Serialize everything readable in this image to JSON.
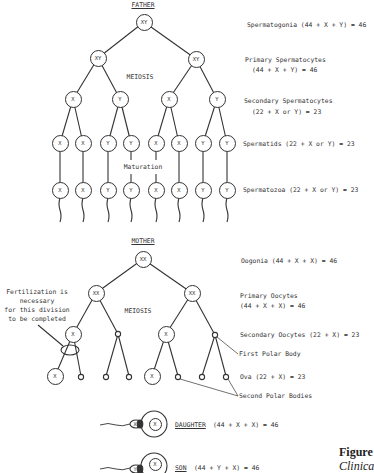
{
  "father": {
    "title": "FATHER",
    "meiosis_label": "MEIOSIS",
    "maturation_label": "Maturation",
    "root": "XY",
    "level2": [
      "XY",
      "XY"
    ],
    "level3": [
      "X",
      "Y",
      "X",
      "Y"
    ],
    "spermatids": [
      "X",
      "X",
      "Y",
      "Y",
      "X",
      "X",
      "Y",
      "Y"
    ],
    "spermatozoa": [
      "X",
      "X",
      "Y",
      "Y",
      "X",
      "X",
      "Y",
      "Y"
    ],
    "stages": {
      "spermatogonia": "Spermatogonia  (44 + X + Y) = 46",
      "primary_line1": "Primary Spermatocytes",
      "primary_line2": "(44 + X + Y) = 46",
      "secondary_line1": "Secondary Spermatocytes",
      "secondary_line2": "(22 + X or Y) = 23",
      "spermatids": "Spermatids  (22 + X or Y) = 23",
      "spermatozoa": "Spermatozoa  (22 + X or Y) = 23"
    }
  },
  "mother": {
    "title": "MOTHER",
    "meiosis_label": "MEIOSIS",
    "root": "XX",
    "level2": [
      "XX",
      "XX"
    ],
    "level3": [
      "X",
      "X"
    ],
    "ova": [
      "X",
      "X"
    ],
    "fertilization_note": [
      "Fertilization is",
      "necessary",
      "for this division",
      "to be completed"
    ],
    "stages": {
      "oogonia": "Oogonia  (44 + X + X) = 46",
      "primary_line1": "Primary Oocytes",
      "primary_line2": "(44 + X + X) = 46",
      "secondary": "Secondary Oocytes  (22 + X) = 23",
      "first_polar_body": "First Polar Body",
      "ova": "Ova  (22 + X) = 23",
      "second_polar_bodies": "Second Polar Bodies"
    }
  },
  "offspring": {
    "daughter": {
      "label": "DAUGHTER",
      "formula": "(44 + X + X) = 46",
      "sperm": "X",
      "egg": "X"
    },
    "son": {
      "label": "SON",
      "formula": "(44 + Y + X) = 46",
      "sperm": "Y",
      "egg": "X"
    }
  },
  "caption": {
    "figure": "Figure",
    "subtitle": "Clinica"
  }
}
